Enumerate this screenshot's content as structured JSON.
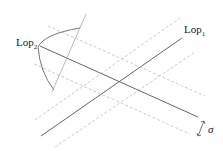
{
  "diagram": {
    "labels": {
      "lop1": "Lop",
      "lop1_sub": "1",
      "lop2": "Lop",
      "lop2_sub": "2",
      "sigma": "σ"
    },
    "colors": {
      "solid_line": "#666666",
      "dashed_line": "#cccccc",
      "curve": "#777777",
      "text": "#222222"
    }
  }
}
